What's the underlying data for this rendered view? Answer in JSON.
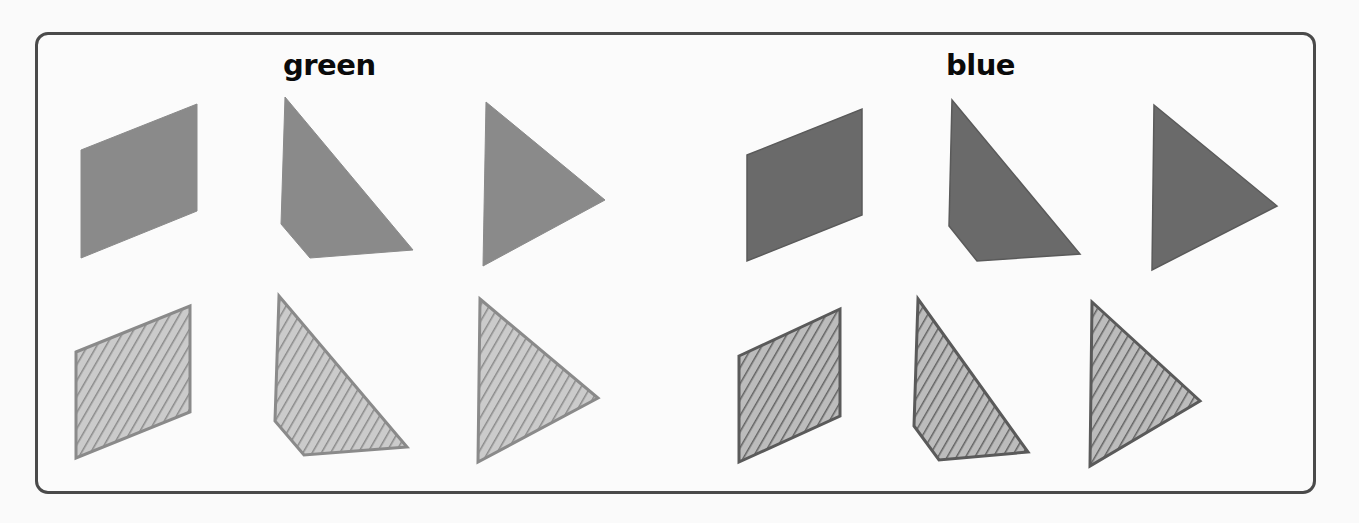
{
  "groups": [
    {
      "label": "green",
      "solid_color": "#8a8a8a",
      "hatch_line_color": "#8a8a8a",
      "hatch_bg_color": "#cbcbcb",
      "stroke_color": "#8a8a8a"
    },
    {
      "label": "blue",
      "solid_color": "#6a6a6a",
      "hatch_line_color": "#626262",
      "hatch_bg_color": "#bcbcbc",
      "stroke_color": "#5a5a5a"
    }
  ],
  "shape_kinds": [
    "parallelogram",
    "quadrilateral",
    "triangle"
  ],
  "rows": [
    "solid",
    "hatched"
  ]
}
